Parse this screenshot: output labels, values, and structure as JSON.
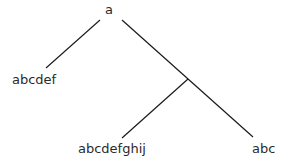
{
  "diagram": {
    "type": "tree",
    "nodes": [
      {
        "id": "root",
        "label": "a",
        "x": 111,
        "y": 14
      },
      {
        "id": "left",
        "label": "abcdef",
        "x": 12,
        "y": 84
      },
      {
        "id": "mid",
        "label": "abcdefghij",
        "x": 78,
        "y": 153
      },
      {
        "id": "right",
        "label": "abc",
        "x": 252,
        "y": 153
      }
    ],
    "edges": [
      {
        "from": "root",
        "to": "left"
      },
      {
        "from": "root",
        "to": "right"
      },
      {
        "from": "branch-point",
        "to": "mid"
      }
    ],
    "colors": {
      "line": "#1a1a1a",
      "text": "#2a2a2a",
      "background": "#ffffff"
    }
  }
}
